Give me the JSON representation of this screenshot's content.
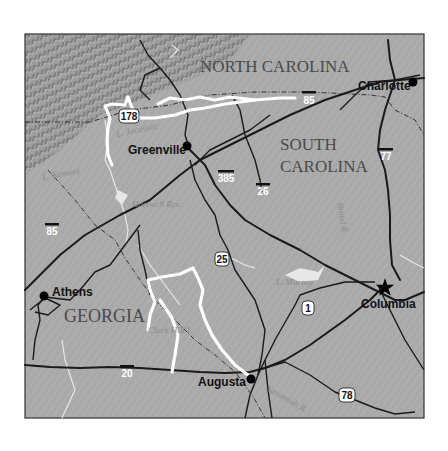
{
  "map": {
    "states": [
      {
        "name": "NORTH CAROLINA"
      },
      {
        "name_line1": "SOUTH",
        "name_line2": "CAROLINA"
      },
      {
        "name": "GEORGIA"
      }
    ],
    "cities": [
      {
        "name": "Charlotte",
        "symbol": "dot"
      },
      {
        "name": "Greenville",
        "symbol": "dot"
      },
      {
        "name": "Athens",
        "symbol": "dot"
      },
      {
        "name": "Columbia",
        "symbol": "star-capital"
      },
      {
        "name": "Augusta",
        "symbol": "dot"
      }
    ],
    "water_features": [
      {
        "name": "L. Keowee"
      },
      {
        "name": "L. Jocassee"
      },
      {
        "name": "Hartwell Res."
      },
      {
        "name": "L. Murray"
      },
      {
        "name": "Clark Hill L."
      },
      {
        "name": "Broad R."
      },
      {
        "name": "Savannah R."
      }
    ],
    "interstates": [
      "85",
      "85",
      "385",
      "26",
      "77",
      "20"
    ],
    "us_routes": [
      "178",
      "25",
      "1",
      "78"
    ],
    "colors": {
      "terrain": "#a6a6a6",
      "roads": "#1a1a1a",
      "highlight_route": "#ffffff",
      "frame": "#333333"
    }
  }
}
